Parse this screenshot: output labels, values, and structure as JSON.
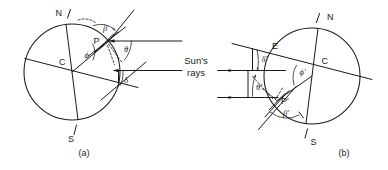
{
  "figure": {
    "background_color": "#ffffff",
    "ink_color": "#1a1a1a",
    "sun_rays_label_line1": "Sun's",
    "sun_rays_label_line2": "rays",
    "panels": [
      {
        "caption": "(a)",
        "north_pole_label": "N",
        "south_pole_label": "S",
        "center_label": "C",
        "point_label": "P",
        "angles": [
          {
            "symbol": "β",
            "name": "beta"
          },
          {
            "symbol": "θ",
            "name": "theta"
          },
          {
            "symbol": "ϕ",
            "name": "phi"
          },
          {
            "symbol": "δ",
            "name": "delta"
          }
        ]
      },
      {
        "caption": "(b)",
        "north_pole_label": "N",
        "south_pole_label": "S",
        "center_label": "C",
        "point_label": "P′",
        "equator_point_label": "E",
        "angles": [
          {
            "symbol": "δ′",
            "name": "delta-prime"
          },
          {
            "symbol": "θ′",
            "name": "theta-prime"
          },
          {
            "symbol": "ϕ′",
            "name": "phi-prime"
          },
          {
            "symbol": "β′",
            "name": "beta-prime"
          }
        ]
      }
    ]
  }
}
